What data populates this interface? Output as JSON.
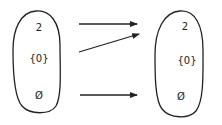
{
  "diagram": {
    "type": "set-mapping",
    "stroke_color": "#222222",
    "left_set": {
      "elements": [
        {
          "label": "2",
          "x": 39,
          "y": 27
        },
        {
          "label": "{0}",
          "x": 39,
          "y": 58
        },
        {
          "label": "Ø",
          "x": 39,
          "y": 95
        }
      ]
    },
    "right_set": {
      "elements": [
        {
          "label": "2",
          "x": 185,
          "y": 26
        },
        {
          "label": "{0}",
          "x": 187,
          "y": 60
        },
        {
          "label": "Ø",
          "x": 181,
          "y": 96
        }
      ]
    },
    "arrows": [
      {
        "from": "2",
        "to": "2"
      },
      {
        "from": "{0}",
        "to": "2"
      },
      {
        "from": "Ø",
        "to": "Ø"
      }
    ]
  }
}
